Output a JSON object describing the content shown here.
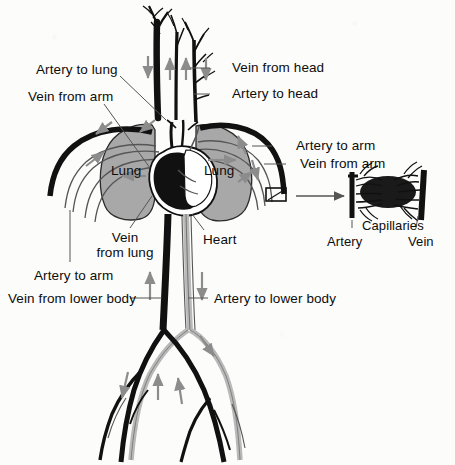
{
  "figure": {
    "background_color": "#fcfcfa",
    "ink_color": "#111111",
    "lung_fill": "#a8a8a8",
    "artery_fill": "#c9c9c9",
    "vein_fill": "#111111",
    "arrow_color": "#8c8c8c"
  },
  "labels": {
    "artery_to_lung": "Artery to lung",
    "vein_from_arm_left": "Vein from arm",
    "vein_from_head": "Vein from head",
    "artery_to_head": "Artery to head",
    "artery_to_arm_right": "Artery to arm",
    "vein_from_arm_right": "Vein from arm",
    "lung_left": "Lung",
    "lung_right": "Lung",
    "vein_from_lung": "Vein\nfrom lung",
    "vein_from_lung_line1": "Vein",
    "vein_from_lung_line2": "from lung",
    "heart": "Heart",
    "artery_to_arm_left": "Artery to arm",
    "vein_from_lower_body": "Vein from lower body",
    "artery_to_lower_body": "Artery to lower body",
    "capillaries": "Capillaries",
    "artery_inset": "Artery",
    "vein_inset": "Vein"
  },
  "inset": {
    "name": "capillary-bed-detail",
    "source_box": "magnified region on arm vessels",
    "left_vessel": "Artery",
    "right_vessel": "Vein",
    "network": "Capillaries"
  },
  "flow_arrows": [
    {
      "id": "head-vein-down-left",
      "direction": "down"
    },
    {
      "id": "head-artery-up-1",
      "direction": "up"
    },
    {
      "id": "head-artery-up-2",
      "direction": "up"
    },
    {
      "id": "head-vein-down-right",
      "direction": "down"
    },
    {
      "id": "arm-left-out",
      "direction": "out"
    },
    {
      "id": "arm-left-in",
      "direction": "in"
    },
    {
      "id": "arm-right-up",
      "direction": "up"
    },
    {
      "id": "arm-right-down",
      "direction": "down"
    },
    {
      "id": "lung-left-flow",
      "direction": "left"
    },
    {
      "id": "lung-right-flow",
      "direction": "right"
    },
    {
      "id": "trunk-vein-up",
      "direction": "up"
    },
    {
      "id": "trunk-artery-down",
      "direction": "down"
    },
    {
      "id": "leg-right-down",
      "direction": "down"
    },
    {
      "id": "leg-left-down",
      "direction": "down"
    },
    {
      "id": "leg-vein-up-1",
      "direction": "up"
    },
    {
      "id": "leg-vein-up-2",
      "direction": "up"
    }
  ]
}
